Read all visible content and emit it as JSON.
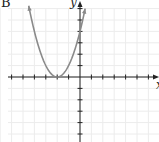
{
  "panel_label": "B",
  "chart_data": {
    "type": "line",
    "title": "",
    "xlabel": "x",
    "ylabel": "y",
    "function": "y = (x + 2)^2",
    "vertex": [
      -2,
      0
    ],
    "y_intercept": [
      0,
      4
    ],
    "x": [
      -4.5,
      -4,
      -3.5,
      -3,
      -2.5,
      -2,
      -1.5,
      -1,
      -0.5,
      0,
      0.45
    ],
    "series": [
      {
        "name": "parabola",
        "values": [
          6.25,
          4,
          2.25,
          1,
          0.25,
          0,
          0.25,
          1,
          2.25,
          4,
          6.0
        ]
      }
    ],
    "xlim": [
      -7,
      7
    ],
    "ylim": [
      -6,
      6.6
    ],
    "grid": true,
    "tick_step": 1,
    "tick_labels_shown": false,
    "legend": null,
    "colors": {
      "curve": "#8a8a8a",
      "axes": "#222222",
      "grid": "#ececec"
    }
  }
}
